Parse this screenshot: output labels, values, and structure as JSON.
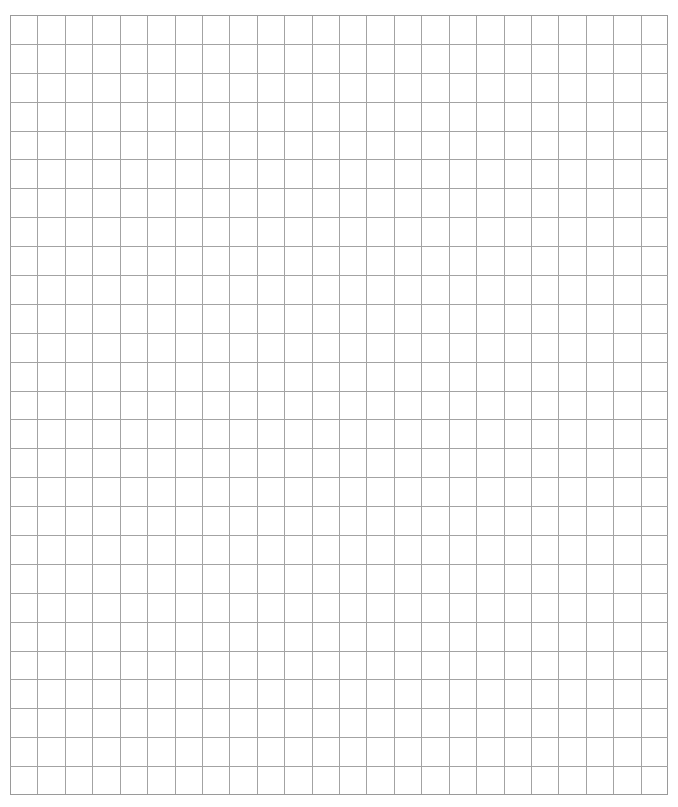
{
  "page": {
    "type": "graph-paper",
    "background_color": "#ffffff"
  },
  "header": {
    "clipped_text": ""
  },
  "grid": {
    "left": 10,
    "top": 15,
    "width": 658,
    "height": 780,
    "columns": 24,
    "rows": 27,
    "line_color": "#a3a3a3",
    "border_color": "#9a9a9a",
    "line_width": 1
  }
}
